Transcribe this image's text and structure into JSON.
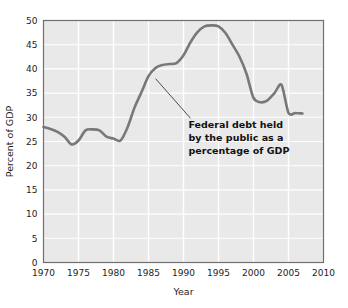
{
  "figure": {
    "background_color": "#ffffff",
    "partial_top_text": "",
    "plot_background_color": "#e9e9e9",
    "gridline_color": "#ffffff",
    "frame_color": "#6f6f6f",
    "line_color": "#77787b"
  },
  "chart_data": {
    "type": "line",
    "title": "",
    "xlabel": "Year",
    "ylabel": "Percent of GDP",
    "xlim": [
      1970,
      2010
    ],
    "ylim": [
      0,
      50
    ],
    "xticks": [
      1970,
      1975,
      1980,
      1985,
      1990,
      1995,
      2000,
      2005,
      2010
    ],
    "yticks": [
      0,
      5,
      10,
      15,
      20,
      25,
      30,
      35,
      40,
      45,
      50
    ],
    "grid": true,
    "legend": null,
    "series": [
      {
        "name": "Federal debt held by the public as a percentage of GDP",
        "x": [
          1970,
          1971,
          1972,
          1973,
          1974,
          1975,
          1976,
          1977,
          1978,
          1979,
          1980,
          1981,
          1982,
          1983,
          1984,
          1985,
          1986,
          1987,
          1988,
          1989,
          1990,
          1991,
          1992,
          1993,
          1994,
          1995,
          1996,
          1997,
          1998,
          1999,
          2000,
          2001,
          2002,
          2003,
          2004,
          2005,
          2006,
          2007
        ],
        "y": [
          28.0,
          27.6,
          27.0,
          26.0,
          24.4,
          25.2,
          27.3,
          27.5,
          27.3,
          26.0,
          25.6,
          25.2,
          27.9,
          32.0,
          35.2,
          38.5,
          40.2,
          40.8,
          41.0,
          41.2,
          42.8,
          45.5,
          47.6,
          48.8,
          49.0,
          48.8,
          47.4,
          45.0,
          42.5,
          39.0,
          34.0,
          33.1,
          33.5,
          35.0,
          36.7,
          30.9,
          30.9,
          30.8
        ]
      }
    ],
    "annotation": {
      "lines": [
        "Federal debt held",
        "by the public as a",
        "percentage of GDP"
      ],
      "leader_from": [
        1986,
        38.0
      ],
      "leader_to": [
        1991,
        29.8
      ]
    }
  }
}
